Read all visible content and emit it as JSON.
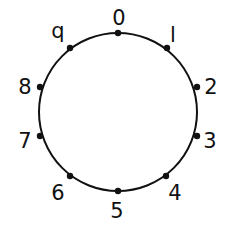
{
  "diagram": {
    "type": "circle-with-labeled-points",
    "circle": {
      "cx": 118,
      "cy": 112,
      "r": 79,
      "stroke": "#111111",
      "stroke_width": 2
    },
    "point_color": "#111111",
    "point_radius": 3.2,
    "points": [
      {
        "label": "0",
        "x": 118,
        "y": 33,
        "lx": 119,
        "ly": 25
      },
      {
        "label": "l",
        "x": 167,
        "y": 48,
        "lx": 173,
        "ly": 42
      },
      {
        "label": "2",
        "x": 197,
        "y": 87,
        "lx": 211,
        "ly": 94
      },
      {
        "label": "3",
        "x": 197,
        "y": 136,
        "lx": 210,
        "ly": 148
      },
      {
        "label": "4",
        "x": 166,
        "y": 176,
        "lx": 175,
        "ly": 200
      },
      {
        "label": "5",
        "x": 118,
        "y": 191,
        "lx": 117,
        "ly": 218
      },
      {
        "label": "6",
        "x": 70,
        "y": 176,
        "lx": 58,
        "ly": 200
      },
      {
        "label": "7",
        "x": 40,
        "y": 136,
        "lx": 25,
        "ly": 148
      },
      {
        "label": "8",
        "x": 40,
        "y": 87,
        "lx": 25,
        "ly": 94
      },
      {
        "label": "q",
        "x": 70,
        "y": 48,
        "lx": 58,
        "ly": 38
      }
    ]
  }
}
